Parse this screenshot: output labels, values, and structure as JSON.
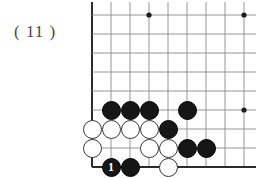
{
  "figure": {
    "label": "（11）",
    "caption_text": "( 11 )"
  },
  "board": {
    "type": "go-board-corner-diagram",
    "grid": {
      "spacing": 19,
      "origin_x": 92,
      "origin_y": 15,
      "cols": 9,
      "rows": 9,
      "edge_left": true,
      "edge_bottom": true,
      "edge_top": false,
      "edge_right": false,
      "line_color": "#8a8a8a",
      "edge_color": "#2b2b2b"
    },
    "star_points": [
      {
        "col": 3,
        "row": 0
      },
      {
        "col": 8,
        "row": 0
      },
      {
        "col": 8,
        "row": 5
      }
    ],
    "stones": [
      {
        "col": 1,
        "row": 5,
        "color": "black",
        "label": ""
      },
      {
        "col": 2,
        "row": 5,
        "color": "black",
        "label": ""
      },
      {
        "col": 3,
        "row": 5,
        "color": "black",
        "label": ""
      },
      {
        "col": 5,
        "row": 5,
        "color": "black",
        "label": ""
      },
      {
        "col": 0,
        "row": 6,
        "color": "white",
        "label": ""
      },
      {
        "col": 1,
        "row": 6,
        "color": "white",
        "label": ""
      },
      {
        "col": 2,
        "row": 6,
        "color": "white",
        "label": ""
      },
      {
        "col": 3,
        "row": 6,
        "color": "white",
        "label": ""
      },
      {
        "col": 4,
        "row": 6,
        "color": "black",
        "label": ""
      },
      {
        "col": 0,
        "row": 7,
        "color": "white",
        "label": ""
      },
      {
        "col": 3,
        "row": 7,
        "color": "white",
        "label": ""
      },
      {
        "col": 4,
        "row": 7,
        "color": "white",
        "label": ""
      },
      {
        "col": 5,
        "row": 7,
        "color": "black",
        "label": ""
      },
      {
        "col": 6,
        "row": 7,
        "color": "black",
        "label": ""
      },
      {
        "col": 1,
        "row": 8,
        "color": "black",
        "label": "1"
      },
      {
        "col": 2,
        "row": 8,
        "color": "black",
        "label": ""
      },
      {
        "col": 4,
        "row": 8,
        "color": "white",
        "label": ""
      }
    ],
    "stone_diameter": 19
  }
}
